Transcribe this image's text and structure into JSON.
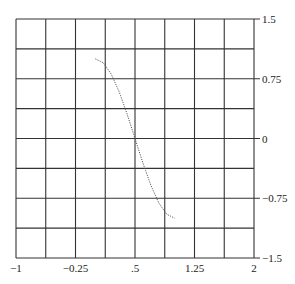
{
  "chart_data": {
    "type": "line",
    "title": "",
    "xlabel": "",
    "ylabel": "",
    "xlim": [
      -1,
      2
    ],
    "ylim": [
      -1.5,
      1.5
    ],
    "grid": true,
    "x_gridlines": 9,
    "y_gridlines": 9,
    "x_tick_labels": [
      {
        "value": -1,
        "label": "−1"
      },
      {
        "value": -0.25,
        "label": "−0.25"
      },
      {
        "value": 0.5,
        "label": ".5"
      },
      {
        "value": 1.25,
        "label": "1.25"
      },
      {
        "value": 2,
        "label": "2"
      }
    ],
    "y_tick_labels": [
      {
        "value": 1.5,
        "label": "1.5"
      },
      {
        "value": 0.75,
        "label": "0.75"
      },
      {
        "value": 0,
        "label": "0"
      },
      {
        "value": -0.75,
        "label": "−0.75"
      },
      {
        "value": -1.5,
        "label": "−1.5"
      }
    ],
    "series": [
      {
        "name": "y = cos(πx)",
        "style": "dotted",
        "color": "#555555",
        "x": [
          0,
          0.1,
          0.2,
          0.3,
          0.4,
          0.5,
          0.6,
          0.7,
          0.8,
          0.9,
          1.0
        ],
        "y": [
          1.0,
          0.951,
          0.809,
          0.588,
          0.309,
          0.0,
          -0.309,
          -0.588,
          -0.809,
          -0.951,
          -1.0
        ]
      }
    ]
  }
}
